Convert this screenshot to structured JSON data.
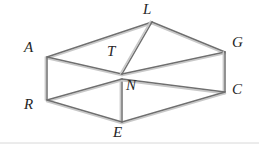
{
  "figure": {
    "type": "geometric-line-drawing",
    "shape_name": "rectangular-prism",
    "canvas": {
      "width": 259,
      "height": 150
    },
    "colors": {
      "background": "#ffffff",
      "edge_stroke": "#6f6f6f",
      "edge_highlight": "#c9c9c9",
      "label_text": "#262626",
      "baseline_rule": "#d8d8d8"
    },
    "vertices": [
      {
        "id": "A",
        "label": "A",
        "x": 47,
        "y": 57,
        "label_x": 24,
        "label_y": 40,
        "role": "top-back-left"
      },
      {
        "id": "L",
        "label": "L",
        "x": 152,
        "y": 22,
        "label_x": 143,
        "label_y": 2,
        "role": "top-back-right"
      },
      {
        "id": "G",
        "label": "G",
        "x": 225,
        "y": 52,
        "label_x": 232,
        "label_y": 35,
        "role": "top-front-right"
      },
      {
        "id": "T",
        "label": "T",
        "x": 122,
        "y": 74,
        "label_x": 107,
        "label_y": 44,
        "role": "top-front-left"
      },
      {
        "id": "R",
        "label": "R",
        "x": 47,
        "y": 100,
        "label_x": 24,
        "label_y": 97,
        "role": "bottom-back-left"
      },
      {
        "id": "N",
        "label": "N",
        "x": 122,
        "y": 79,
        "label_x": 126,
        "label_y": 78,
        "role": "bottom-back-right-hidden"
      },
      {
        "id": "C",
        "label": "C",
        "x": 225,
        "y": 92,
        "label_x": 232,
        "label_y": 82,
        "role": "bottom-front-right"
      },
      {
        "id": "E",
        "label": "E",
        "x": 122,
        "y": 122,
        "label_x": 113,
        "label_y": 125,
        "role": "bottom-front-left"
      }
    ],
    "edges": [
      {
        "from": "A",
        "to": "L",
        "kind": "top-face"
      },
      {
        "from": "L",
        "to": "G",
        "kind": "top-face"
      },
      {
        "from": "A",
        "to": "T",
        "kind": "top-face"
      },
      {
        "from": "T",
        "to": "G",
        "kind": "top-face"
      },
      {
        "from": "A",
        "to": "R",
        "kind": "vertical"
      },
      {
        "from": "L",
        "to": "T",
        "kind": "vertical"
      },
      {
        "from": "G",
        "to": "C",
        "kind": "vertical"
      },
      {
        "from": "N",
        "to": "E",
        "kind": "vertical"
      },
      {
        "from": "R",
        "to": "N",
        "kind": "bottom-face"
      },
      {
        "from": "N",
        "to": "C",
        "kind": "bottom-face"
      },
      {
        "from": "R",
        "to": "E",
        "kind": "bottom-face"
      },
      {
        "from": "E",
        "to": "C",
        "kind": "bottom-face"
      }
    ]
  }
}
